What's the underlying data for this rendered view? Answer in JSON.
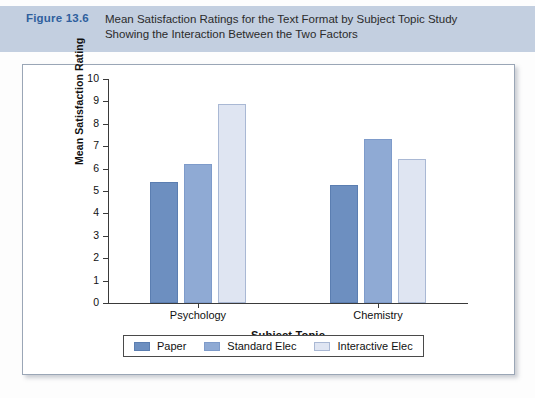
{
  "caption": {
    "figure_number": "Figure 13.6",
    "line1": "Mean Satisfaction Ratings for the Text Format by Subject Topic Study",
    "line2": "Showing the Interaction Between the Two Factors",
    "banner_color": "#c3cfe0",
    "figure_number_color": "#2f5f9e"
  },
  "chart_data": {
    "type": "bar",
    "title": "",
    "xlabel": "Subject Topic",
    "ylabel": "Mean Satisfaction Rating",
    "categories": [
      "Psychology",
      "Chemistry"
    ],
    "ylim": [
      0,
      10
    ],
    "yticks": [
      0,
      1,
      2,
      3,
      4,
      5,
      6,
      7,
      8,
      9,
      10
    ],
    "ytick_labels": [
      "0",
      "1",
      "2",
      "3",
      "4",
      "5",
      "6",
      "7",
      "8",
      "9",
      "10"
    ],
    "grid": false,
    "legend_position": "bottom",
    "series": [
      {
        "name": "Paper",
        "color": "#6d8fc0",
        "values": [
          5.4,
          5.25
        ]
      },
      {
        "name": "Standard Elec",
        "color": "#8faad4",
        "values": [
          6.2,
          7.3
        ]
      },
      {
        "name": "Interactive Elec",
        "color": "#dfe5f2",
        "values": [
          8.9,
          6.45
        ]
      }
    ]
  }
}
